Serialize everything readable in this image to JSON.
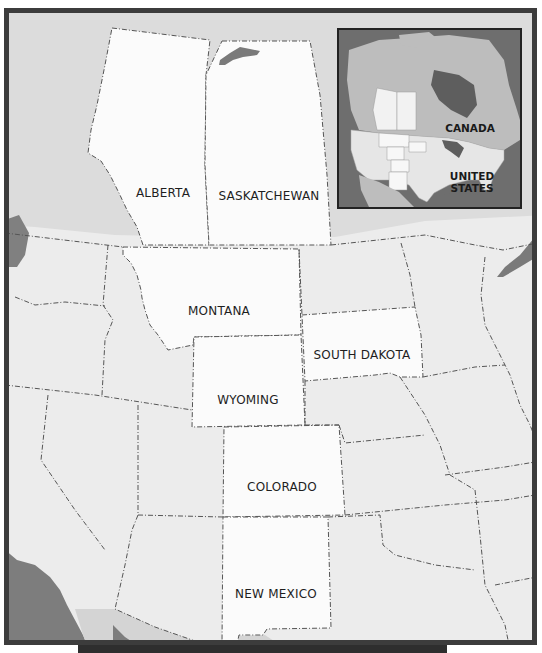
{
  "map": {
    "title": "",
    "highlight_color": "#fbfbfb",
    "land_color": "#ececec",
    "canada_land_color": "#dedede",
    "water_color": "#7a7a7a",
    "frame_color": "#3c3c3c",
    "regions": [
      {
        "name": "ALBERTA",
        "x": 158,
        "y": 188
      },
      {
        "name": "SASKATCHEWAN",
        "x": 264,
        "y": 191
      },
      {
        "name": "MONTANA",
        "x": 214,
        "y": 306
      },
      {
        "name": "SOUTH DAKOTA",
        "x": 357,
        "y": 350
      },
      {
        "name": "WYOMING",
        "x": 243,
        "y": 395
      },
      {
        "name": "COLORADO",
        "x": 277,
        "y": 482
      },
      {
        "name": "NEW MEXICO",
        "x": 271,
        "y": 589
      }
    ]
  },
  "inset": {
    "labels": [
      {
        "name": "CANADA",
        "x": 131,
        "y": 104
      },
      {
        "name": "UNITED\nSTATES",
        "line1": "UNITED",
        "line2": "STATES",
        "x": 133,
        "y": 158
      }
    ]
  },
  "caption": {
    "text": ""
  }
}
